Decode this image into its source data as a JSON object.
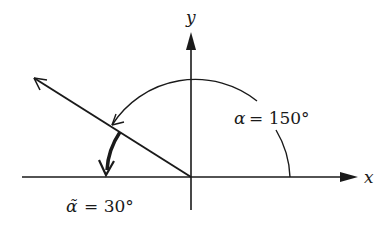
{
  "diagram": {
    "type": "angle-in-standard-position",
    "axes": {
      "x_label": "x",
      "y_label": "y"
    },
    "angle": {
      "symbol": "α",
      "value_label": "= 150°",
      "degrees": 150
    },
    "reference_angle": {
      "symbol": "α̃",
      "value_label": "= 30°",
      "degrees": 30
    },
    "colors": {
      "stroke": "#1a1a1a",
      "background": "#ffffff"
    }
  }
}
